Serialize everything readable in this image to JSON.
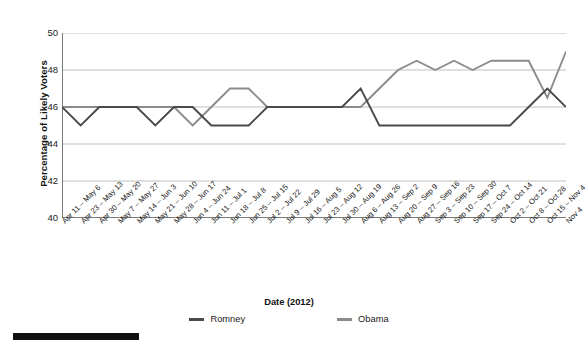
{
  "chart_data": {
    "type": "line",
    "title": "",
    "xlabel": "Date (2012)",
    "ylabel": "Percentage of Likely Voters",
    "ylim": [
      40,
      50
    ],
    "yticks": [
      40,
      42,
      44,
      46,
      48,
      50
    ],
    "grid": true,
    "legend_position": "bottom",
    "categories": [
      "Apr 11 – May 6",
      "Apr 23 – May 13",
      "Apr 30 – May 20",
      "May 7 – May 27",
      "May 14 – Jun 3",
      "May 21 – Jun 10",
      "May 28 – Jun 17",
      "Jun 4 – Jun 24",
      "Jun 11 – Jul 1",
      "Jun 18 – Jul 8",
      "Jun 25 – Jul 15",
      "Jul 2 – Jul 22",
      "Jul 9 – Jul 29",
      "Jul 16 – Aug 5",
      "Jul 23 – Aug 12",
      "Jul 30 – Aug 19",
      "Aug 6 – Aug 26",
      "Aug 13 – Sep 2",
      "Aug 20 – Sep 9",
      "Aug 27 – Sep 16",
      "Sep 3 – Sep 23",
      "Sep 10 – Sep 30",
      "Sep 17 – Oct 7",
      "Sep 24 – Oct 14",
      "Oct 2 – Oct 21",
      "Oct 8 – Oct 28",
      "Oct 15 – Nov 4",
      "Nov 4"
    ],
    "series": [
      {
        "name": "Romney",
        "color": "#4a4a4a",
        "values": [
          46,
          45,
          46,
          46,
          46,
          45,
          46,
          46,
          45,
          45,
          45,
          46,
          46,
          46,
          46,
          46,
          47,
          45,
          45,
          45,
          45,
          45,
          45,
          45,
          45,
          46,
          47,
          46
        ]
      },
      {
        "name": "Obama",
        "color": "#8b8b8b",
        "values": [
          46,
          46,
          46,
          46,
          46,
          46,
          46,
          45,
          46,
          47,
          47,
          46,
          46,
          46,
          46,
          46,
          46,
          47,
          48,
          48.5,
          48,
          48.5,
          48,
          48.5,
          48.5,
          48.5,
          46.5,
          49
        ]
      }
    ]
  },
  "legend": {
    "items": [
      {
        "label": "Romney",
        "color": "#4a4a4a"
      },
      {
        "label": "Obama",
        "color": "#8b8b8b"
      }
    ]
  },
  "axis": {
    "x_title": "Date (2012)",
    "y_title": "Percentage of Likely Voters"
  },
  "colors": {
    "grid": "#b9b9b9",
    "axis": "#5a5a5a",
    "romney": "#4a4a4a",
    "obama": "#8b8b8b",
    "bottom_bar": "#101010"
  }
}
